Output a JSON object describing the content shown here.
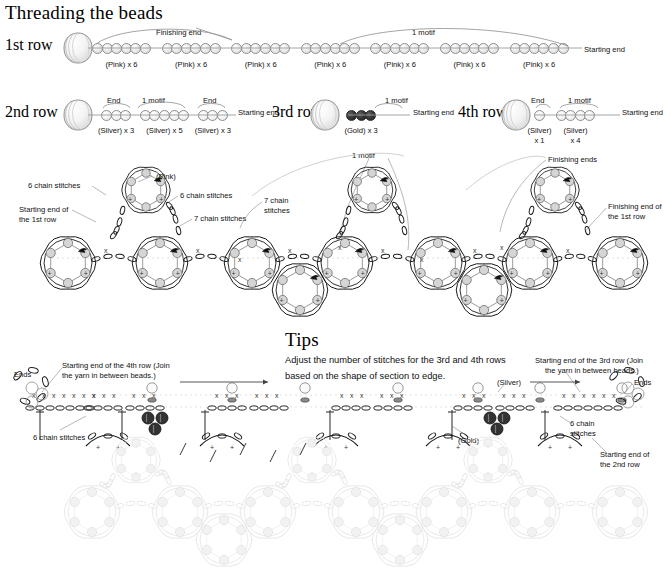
{
  "page": {
    "section1_title": "Threading the beads",
    "tips_title": "Tips"
  },
  "threading": {
    "row1": {
      "label": "1st row",
      "icon": "yarn-ball-icon",
      "bracket_left_label": "Finishing end",
      "bracket_right_label": "1 motif",
      "end_label": "Starting end",
      "groups": [
        {
          "caption": "(Pink) x 6",
          "count": 6,
          "color": "pink"
        },
        {
          "caption": "(Pink) x 6",
          "count": 6,
          "color": "pink"
        },
        {
          "caption": "(Pink) x 6",
          "count": 6,
          "color": "pink"
        },
        {
          "caption": "(Pink) x 6",
          "count": 6,
          "color": "pink"
        },
        {
          "caption": "(Pink) x 6",
          "count": 6,
          "color": "pink"
        },
        {
          "caption": "(Pink) x 6",
          "count": 6,
          "color": "pink"
        },
        {
          "caption": "(Pink) x 6",
          "count": 6,
          "color": "pink"
        }
      ]
    },
    "row2": {
      "label": "2nd row",
      "icon": "yarn-ball-icon",
      "end_label": "Starting end",
      "brackets": [
        "End",
        "1 motif",
        "End"
      ],
      "groups": [
        {
          "caption": "(Silver) x 3",
          "count": 3,
          "color": "silver"
        },
        {
          "caption": "(Silver) x 5",
          "count": 5,
          "color": "silver"
        },
        {
          "caption": "(Silver) x 3",
          "count": 3,
          "color": "silver"
        }
      ]
    },
    "row3": {
      "label": "3rd row",
      "icon": "yarn-ball-icon",
      "end_label": "Starting end",
      "brackets": [
        "1 motif"
      ],
      "groups": [
        {
          "caption": "(Gold) x 3",
          "count": 3,
          "color": "gold"
        }
      ]
    },
    "row4": {
      "label": "4th row",
      "icon": "yarn-ball-icon",
      "end_label": "Starting end",
      "brackets": [
        "End",
        "1 motif"
      ],
      "groups": [
        {
          "caption": "(Silver)\nx 1",
          "caption_line1": "(Silver)",
          "caption_line2": "x 1",
          "count": 1,
          "color": "silver"
        },
        {
          "caption": "(Silver)\nx 4",
          "caption_line1": "(Silver)",
          "caption_line2": "x 4",
          "count": 4,
          "color": "silver"
        }
      ]
    }
  },
  "chart_diagram": {
    "labels": {
      "chain6_left": "6 chain stitches",
      "starting_end_1st_row": "Starting end of\nthe 1st row",
      "starting_end_1st_row_l1": "Starting end of",
      "starting_end_1st_row_l2": "the 1st row",
      "pink": "(Pink)",
      "chain6_mid": "6 chain stitches",
      "chain7_a": "7 chain stitches",
      "chain7_b_l1": "7 chain",
      "chain7_b_l2": "stitches",
      "one_motif": "1 motif",
      "finishing_ends": "Finishing ends",
      "finishing_end_1st_row_l1": "Finishing end of",
      "finishing_end_1st_row_l2": "the 1st row"
    }
  },
  "tips": {
    "title": "Tips",
    "body_line1": "Adjust the number of stitches for the 3rd and 4th rows",
    "body_line2": "based on the shape of section to edge.",
    "labels": {
      "ends_left": "Ends",
      "ends_right": "Ends",
      "start_4th_l1": "Starting end of the 4th row (Join",
      "start_4th_l2": "the yarn in between beads.)",
      "start_3rd_l1": "Starting end of the 3rd row (Join",
      "start_3rd_l2": "the yarn in between beads.)",
      "chain6_left": "6 chain stitches",
      "chain6_right_l1": "6 chain",
      "chain6_right_l2": "stitches",
      "start_2nd_l1": "Starting end of",
      "start_2nd_l2": "the 2nd row",
      "silver": "(Silver)",
      "gold": "(Gold)"
    }
  },
  "colors": {
    "ink": "#111111",
    "line_grey": "#9a9a9a",
    "bead_pink": "#e4e4e4",
    "bead_silver": "#f0f0f0",
    "bead_gold": "#2b2b2b",
    "faded": "#e6e6e6"
  }
}
